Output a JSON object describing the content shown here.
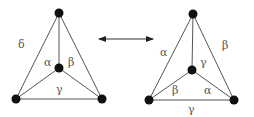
{
  "diagram": {
    "left": {
      "labels": {
        "outer_left": "δ",
        "inner_left": "α",
        "inner_right": "β",
        "inner_bottom": "γ"
      }
    },
    "arrow": {
      "type": "double-headed"
    },
    "right": {
      "labels": {
        "outer_left": "α",
        "outer_right": "β",
        "inner_top": "γ",
        "inner_bottom_left": "β",
        "inner_bottom_right": "α",
        "outer_bottom": "γ"
      }
    }
  }
}
